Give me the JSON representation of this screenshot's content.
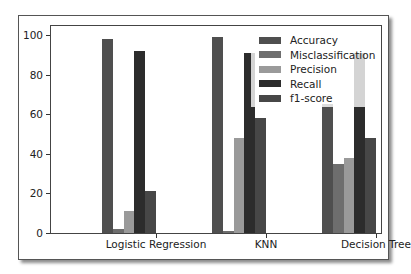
{
  "chart_data": {
    "type": "bar",
    "title": "",
    "xlabel": "",
    "ylabel": "",
    "ylim": [
      0,
      105
    ],
    "yticks": [
      0,
      20,
      40,
      60,
      80,
      100
    ],
    "grid": false,
    "legend_position": "upper right",
    "categories": [
      "Logistic Regression",
      "KNN",
      "Decision Tree"
    ],
    "series": [
      {
        "name": "Accuracy",
        "color": "#4f4f4f",
        "values": [
          98,
          99,
          65
        ]
      },
      {
        "name": "Misclassification",
        "color": "#6e6e6e",
        "values": [
          2,
          1,
          35
        ]
      },
      {
        "name": "Precision",
        "color": "#9a9a9a",
        "values": [
          11,
          48,
          38
        ]
      },
      {
        "name": "Recall",
        "color": "#2c2c2c",
        "values": [
          92,
          91,
          91
        ]
      },
      {
        "name": "f1-score",
        "color": "#474747",
        "values": [
          21,
          58,
          48
        ]
      }
    ]
  }
}
